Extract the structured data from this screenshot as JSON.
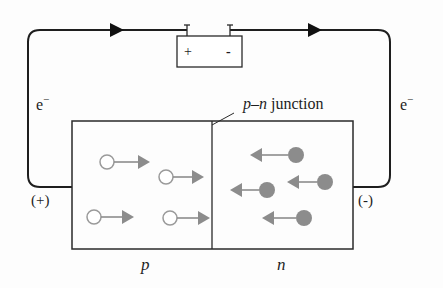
{
  "diagram": {
    "battery": {
      "plus_label": "+",
      "minus_label": "-"
    },
    "wire_labels": {
      "left_electron": "e",
      "left_electron_sup": "−",
      "right_electron": "e",
      "right_electron_sup": "−",
      "left_terminal": "(+)",
      "right_terminal": "(-)"
    },
    "junction_label": {
      "p": "p",
      "dash": "–",
      "n": "n",
      "word": " junction"
    },
    "region_labels": {
      "p": "p",
      "n": "n"
    },
    "holes": [
      {
        "cx": 107,
        "cy": 162,
        "tip": 150
      },
      {
        "cx": 166,
        "cy": 177,
        "tip": 204
      },
      {
        "cx": 94,
        "cy": 217,
        "tip": 134
      },
      {
        "cx": 170,
        "cy": 218,
        "tip": 210
      }
    ],
    "electrons": [
      {
        "cx": 296,
        "cy": 155,
        "tip": 250
      },
      {
        "cx": 325,
        "cy": 182,
        "tip": 287
      },
      {
        "cx": 267,
        "cy": 190,
        "tip": 230
      },
      {
        "cx": 304,
        "cy": 218,
        "tip": 262
      }
    ],
    "colors": {
      "line": "#1e1e1e",
      "carrier_gray": "#8c8c8c",
      "hole_stroke": "#9a9a9a"
    }
  }
}
